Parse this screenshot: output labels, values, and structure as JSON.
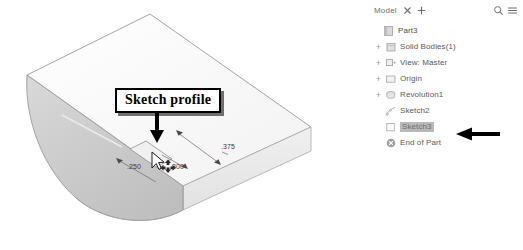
{
  "viewport": {
    "callout": {
      "label": "Sketch profile"
    },
    "dimensions": [
      {
        "name": "depth-dimension",
        "value": ".375"
      },
      {
        "name": "width-dimension",
        "value": ".250"
      },
      {
        "name": "height-dimension",
        "value": ".300"
      }
    ],
    "cursor": {
      "name": "move-gizmo-cursor"
    },
    "colors": {
      "top_face": "#fbfbfb",
      "front_face": "#ededed",
      "end_face": "#c9c9c9",
      "outline": "#8d8d8d"
    }
  },
  "tree_panel": {
    "tabbar": {
      "tab_label": "Model",
      "close_icon": "close-icon",
      "add_icon": "add-tab-icon",
      "search_icon": "search-icon",
      "menu_icon": "hamburger-menu-icon"
    },
    "items": [
      {
        "label": "Part3",
        "icon": "document-icon",
        "indent": 0,
        "expander": "",
        "selected": false
      },
      {
        "label": "Solid Bodies(1)",
        "icon": "solid-bodies-icon",
        "indent": 1,
        "expander": "+",
        "selected": false
      },
      {
        "label": "View: Master",
        "icon": "view-master-icon",
        "indent": 1,
        "expander": "+",
        "selected": false
      },
      {
        "label": "Origin",
        "icon": "origin-folder-icon",
        "indent": 1,
        "expander": "+",
        "selected": false
      },
      {
        "label": "Revolution1",
        "icon": "revolution-icon",
        "indent": 1,
        "expander": "+",
        "selected": false
      },
      {
        "label": "Sketch2",
        "icon": "sketch-icon",
        "indent": 2,
        "expander": "",
        "selected": false
      },
      {
        "label": "Sketch3",
        "icon": "sketch-hidden-icon",
        "indent": 2,
        "expander": "",
        "selected": true
      },
      {
        "label": "End of Part",
        "icon": "end-of-part-icon",
        "indent": 1,
        "expander": "",
        "selected": false
      }
    ],
    "annotation_arrow": {
      "name": "pointer-arrow",
      "color": "#000000"
    }
  }
}
